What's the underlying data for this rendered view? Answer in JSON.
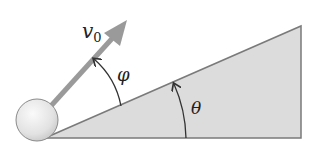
{
  "diagram": {
    "labels": {
      "velocity": "v",
      "velocity_subscript": "0",
      "launch_angle": "φ",
      "incline_angle": "θ"
    },
    "colors": {
      "incline_fill": "#dcdcdc",
      "incline_stroke": "#7a7a7a",
      "arrow": "#9a9a9a",
      "ball_fill": "#e6e6e6",
      "ball_stroke": "#8a8a8a",
      "arc": "#333333"
    }
  }
}
